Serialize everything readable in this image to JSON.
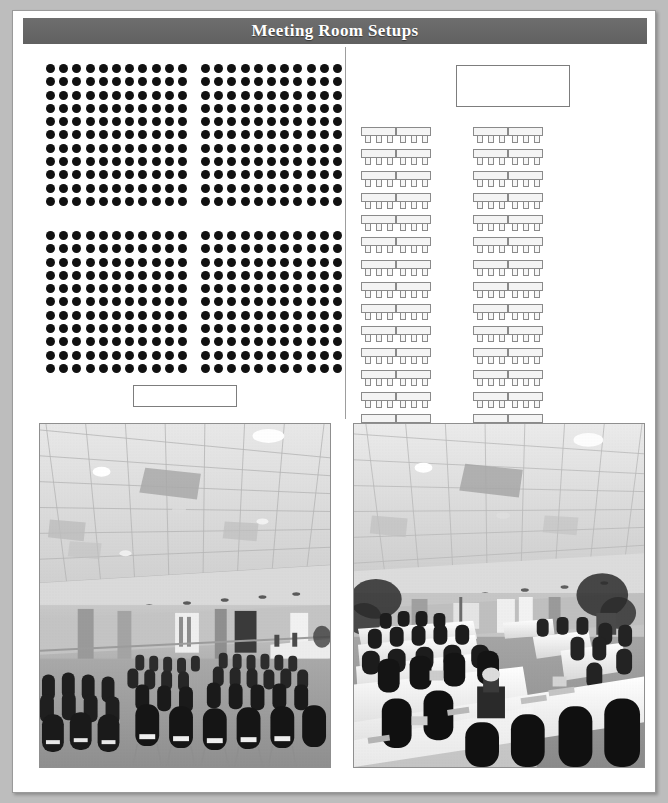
{
  "header": {
    "title": "Meeting Room Setups",
    "banner_color": "#6b6b6b",
    "title_color": "#ffffff"
  },
  "page": {
    "background_color": "#ffffff",
    "outer_background_color": "#bdbdbd",
    "border_color": "#9a9a9a"
  },
  "diagrams": {
    "theater": {
      "name": "theater-style-seating-diagram",
      "seat_dot_color": "#111111",
      "blocks": [
        {
          "name": "front-left",
          "columns": 11,
          "rows": 11
        },
        {
          "name": "front-right",
          "columns": 11,
          "rows": 11
        },
        {
          "name": "rear-left",
          "columns": 11,
          "rows": 11
        },
        {
          "name": "rear-right",
          "columns": 11,
          "rows": 11
        }
      ],
      "total_seats": 484,
      "head_table": {
        "name": "head-table",
        "label": "",
        "fill": "#ffffff",
        "border_color": "#7d7d7d"
      }
    },
    "classroom": {
      "name": "classroom-style-seating-diagram",
      "screen": {
        "name": "screen",
        "label": "",
        "fill": "#ffffff",
        "border_color": "#7d7d7d"
      },
      "table_rows": 14,
      "table_columns": 2,
      "segments_per_group": 2,
      "chairs_per_segment": 3,
      "total_tables": 56,
      "total_chairs": 168,
      "table_fill": "#f4f4f4",
      "table_border_color": "#8a8a8a",
      "chair_fill": "#f6f6f6",
      "chair_border_color": "#8a8a8a"
    }
  },
  "photos": [
    {
      "name": "photo-theater-setup",
      "caption": "",
      "description": "Grayscale photograph of a banquet room arranged theater style with rows of upholstered chairs facing a head table, suspended acoustic tile ceiling with recessed downlights."
    },
    {
      "name": "photo-classroom-setup",
      "caption": "",
      "description": "Grayscale photograph of a banquet room arranged classroom style with linen draped rectangular tables, chairs on one side, water glasses and notepads, potted plants along the walls."
    }
  ]
}
